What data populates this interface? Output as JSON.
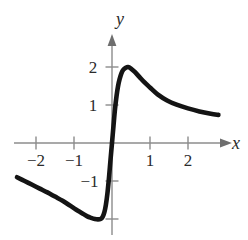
{
  "figure": {
    "background_color": "#ffffff",
    "curve_color": "#141414",
    "axis_color": "#8c8c8c",
    "text_color": "#2b2b2b"
  },
  "axes": {
    "x_label": "x",
    "y_label": "y",
    "origin_px": {
      "x": 112,
      "y": 143
    },
    "unit_px": 38
  },
  "chart_data": {
    "type": "line",
    "title": "",
    "subtitle": "",
    "xlabel": "x",
    "ylabel": "y",
    "xlim": [
      -2.9,
      3.2
    ],
    "ylim": [
      -2.4,
      2.5
    ],
    "xticks": [
      -2,
      -1,
      1,
      2
    ],
    "yticks": [
      2,
      1,
      -1
    ],
    "xtick_labels": [
      "−2",
      "−1",
      "1",
      "2"
    ],
    "ytick_labels": [
      "2",
      "1",
      "−1"
    ],
    "grid": false,
    "legend": false,
    "legend_position": "none",
    "annotations": [],
    "series": [
      {
        "name": "curve",
        "x": [
          -2.5,
          -2.3,
          -2.1,
          -1.9,
          -1.7,
          -1.5,
          -1.3,
          -1.1,
          -0.95,
          -0.8,
          -0.65,
          -0.55,
          -0.45,
          -0.37,
          -0.3,
          -0.25,
          -0.2,
          -0.16,
          -0.12,
          -0.08,
          -0.04,
          0.0,
          0.04,
          0.08,
          0.12,
          0.16,
          0.2,
          0.25,
          0.3,
          0.36,
          0.42,
          0.5,
          0.6,
          0.72,
          0.85,
          1.0,
          1.2,
          1.45,
          1.7,
          2.0,
          2.3,
          2.6,
          2.8
        ],
        "y": [
          -0.9,
          -1.0,
          -1.1,
          -1.2,
          -1.3,
          -1.41,
          -1.52,
          -1.65,
          -1.75,
          -1.84,
          -1.93,
          -1.97,
          -2.0,
          -2.01,
          -2.0,
          -1.95,
          -1.82,
          -1.62,
          -1.32,
          -0.92,
          -0.45,
          0.0,
          0.46,
          0.9,
          1.24,
          1.5,
          1.68,
          1.84,
          1.93,
          1.98,
          2.0,
          1.96,
          1.87,
          1.74,
          1.6,
          1.46,
          1.28,
          1.12,
          1.01,
          0.91,
          0.83,
          0.77,
          0.74
        ]
      }
    ]
  },
  "tick_labels": {
    "x_neg2": "−2",
    "x_neg1": "−1",
    "x_pos1": "1",
    "x_pos2": "2",
    "y_pos2": "2",
    "y_pos1": "1",
    "y_neg1": "−1"
  }
}
